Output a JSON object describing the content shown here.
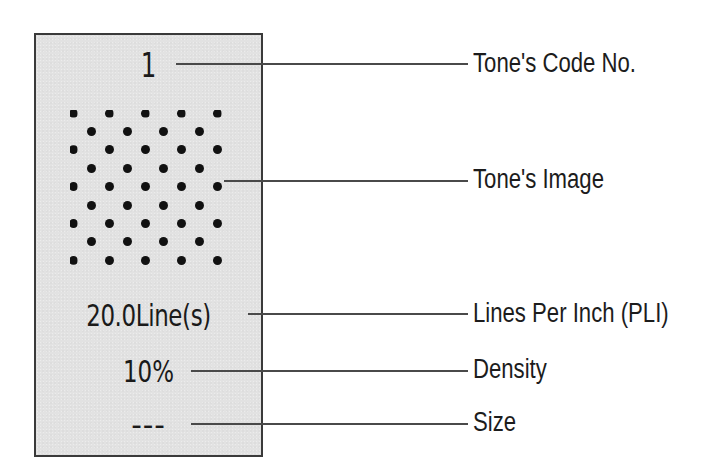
{
  "tone_card": {
    "code_no": "1",
    "lines_value": "20.0Line(s)",
    "density_value": "10%",
    "size_value": "---",
    "colors": {
      "card_background": "#e2e2e2",
      "card_border": "#3a3a3a",
      "dot": "#111111"
    },
    "tone_image": {
      "pattern": "staggered-dot-grid",
      "rows": 9,
      "row_pitch_px": 18.4,
      "column_pitch_px": 36,
      "dot_diameter_px": 9
    }
  },
  "labels": {
    "code_no": "Tone's Code No.",
    "image": "Tone's Image",
    "lines_per_inch": "Lines Per Inch (PLI)",
    "density": "Density",
    "size": "Size"
  }
}
